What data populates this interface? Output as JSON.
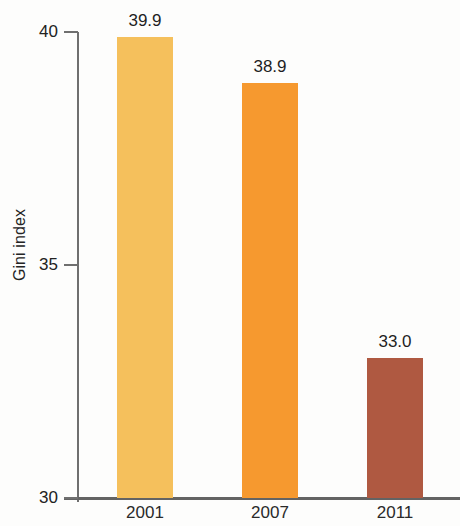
{
  "chart_data": {
    "type": "bar",
    "title": "",
    "subtitle": "",
    "xlabel": "",
    "ylabel": "Gini index",
    "categories": [
      "2001",
      "2007",
      "2011"
    ],
    "values": [
      39.9,
      38.9,
      33.0
    ],
    "value_labels": [
      "39.9",
      "38.9",
      "33.0"
    ],
    "ylim": [
      30,
      40
    ],
    "y_ticks": [
      40,
      35,
      30
    ],
    "y_tick_labels": [
      "40",
      "35",
      "30"
    ],
    "grid": false,
    "legend": "none",
    "bar_colors": [
      "#F5C05C",
      "#F6992F",
      "#AF5941"
    ],
    "axis_color": "#6f6f6f",
    "text_color": "#1f1f1f",
    "background": "#fdfdfc",
    "series": [
      {
        "name": "Gini index",
        "values": [
          39.9,
          38.9,
          33.0
        ]
      }
    ]
  }
}
